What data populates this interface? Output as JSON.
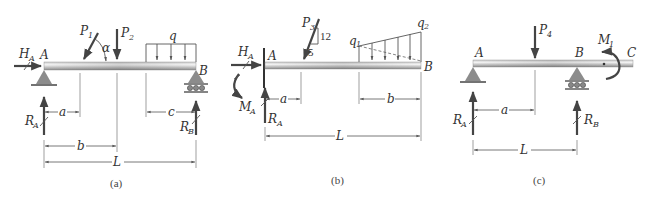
{
  "figure": {
    "panels": [
      {
        "id": "a",
        "caption": "(a)",
        "beam": "simply supported: pin at A, roller at B",
        "labels": {
          "point_a": "A",
          "point_b": "B",
          "h_a": "H",
          "h_a_sub": "A",
          "p1": "P",
          "p1_sub": "1",
          "alpha": "α",
          "p2": "P",
          "p2_sub": "2",
          "q": "q",
          "r_a": "R",
          "r_a_sub": "A",
          "r_b": "R",
          "r_b_sub": "B",
          "dim_a": "a",
          "dim_b": "b",
          "dim_c": "c",
          "dim_l": "L"
        }
      },
      {
        "id": "b",
        "caption": "(b)",
        "beam": "cantilever fixed at A, free at B",
        "labels": {
          "point_a": "A",
          "point_b": "B",
          "h_a": "H",
          "h_a_sub": "A",
          "m_a": "M",
          "m_a_sub": "A",
          "r_a": "R",
          "r_a_sub": "A",
          "p3": "P",
          "p3_sub": "3",
          "slope_rise": "12",
          "slope_run": "5",
          "q1": "q",
          "q1_sub": "1",
          "q2": "q",
          "q2_sub": "2",
          "dim_a": "a",
          "dim_b": "b",
          "dim_l": "L"
        }
      },
      {
        "id": "c",
        "caption": "(c)",
        "beam": "overhanging beam: pin at A, roller at B, free end C",
        "labels": {
          "point_a": "A",
          "point_b": "B",
          "point_c": "C",
          "p4": "P",
          "p4_sub": "4",
          "m1": "M",
          "m1_sub": "1",
          "r_a": "R",
          "r_a_sub": "A",
          "r_b": "R",
          "r_b_sub": "B",
          "dim_a": "a",
          "dim_l": "L"
        }
      }
    ],
    "colors": {
      "beam_light": "#f2f2f2",
      "beam_dark": "#8a8a8a",
      "support": "#8c8c8c",
      "force": "#444444",
      "text": "#333333"
    }
  }
}
